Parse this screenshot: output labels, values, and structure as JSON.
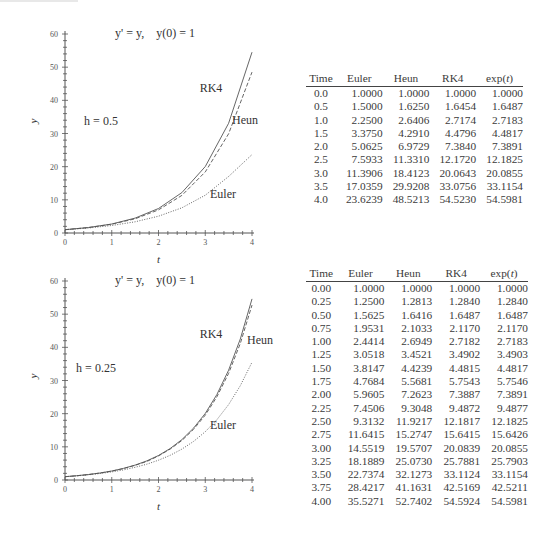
{
  "chart_data": [
    {
      "type": "line",
      "title": "y' = y,    y(0) = 1",
      "annotation": "h = 0.5",
      "xlabel": "t",
      "ylabel": "y",
      "xlim": [
        0,
        4
      ],
      "ylim": [
        0,
        60
      ],
      "xticks": [
        "0",
        "1",
        "2",
        "3",
        "4"
      ],
      "yticks": [
        "0",
        "10",
        "20",
        "30",
        "40",
        "50",
        "60"
      ],
      "grid": false,
      "x": [
        0.0,
        0.5,
        1.0,
        1.5,
        2.0,
        2.5,
        3.0,
        3.5,
        4.0
      ],
      "series": [
        {
          "name": "Euler",
          "style": "dotted",
          "values": [
            1.0,
            1.5,
            2.25,
            3.375,
            5.0625,
            7.5933,
            11.3906,
            17.0359,
            23.6239
          ]
        },
        {
          "name": "Heun",
          "style": "dashed",
          "values": [
            1.0,
            1.625,
            2.6406,
            4.291,
            6.9729,
            11.331,
            18.4123,
            29.9208,
            48.5213
          ]
        },
        {
          "name": "RK4",
          "style": "solid",
          "values": [
            1.0,
            1.6454,
            2.7174,
            4.4796,
            7.384,
            12.172,
            20.0643,
            33.0756,
            54.523
          ]
        }
      ]
    },
    {
      "type": "line",
      "title": "y' = y,    y(0) = 1",
      "annotation": "h = 0.25",
      "xlabel": "t",
      "ylabel": "y",
      "xlim": [
        0,
        4
      ],
      "ylim": [
        0,
        60
      ],
      "xticks": [
        "0",
        "1",
        "2",
        "3",
        "4"
      ],
      "yticks": [
        "0",
        "10",
        "20",
        "30",
        "40",
        "50",
        "60"
      ],
      "grid": false,
      "x": [
        0.0,
        0.25,
        0.5,
        0.75,
        1.0,
        1.25,
        1.5,
        1.75,
        2.0,
        2.25,
        2.5,
        2.75,
        3.0,
        3.25,
        3.5,
        3.75,
        4.0
      ],
      "series": [
        {
          "name": "Euler",
          "style": "dotted",
          "values": [
            1.0,
            1.25,
            1.5625,
            1.9531,
            2.4414,
            3.0518,
            3.8147,
            4.7684,
            5.9605,
            7.4506,
            9.3132,
            11.6415,
            14.5519,
            18.1889,
            22.7374,
            28.4217,
            35.5271
          ]
        },
        {
          "name": "Heun",
          "style": "dashed",
          "values": [
            1.0,
            1.2813,
            1.6416,
            2.1033,
            2.6949,
            3.4521,
            4.4239,
            5.5681,
            7.2623,
            9.3048,
            11.9217,
            15.2747,
            19.5707,
            25.073,
            32.1273,
            41.1631,
            52.7402
          ]
        },
        {
          "name": "RK4",
          "style": "solid",
          "values": [
            1.0,
            1.284,
            1.6487,
            2.117,
            2.7182,
            3.4902,
            4.4815,
            5.7543,
            7.3887,
            9.4872,
            12.1817,
            15.6415,
            20.0839,
            25.7881,
            33.1124,
            42.5169,
            54.5924
          ]
        }
      ]
    },
    {
      "type": "table",
      "columns": [
        "Time",
        "Euler",
        "Heun",
        "RK4",
        "exp(t)"
      ],
      "rows": [
        [
          "0.0",
          "1.0000",
          "1.0000",
          "1.0000",
          "1.0000"
        ],
        [
          "0.5",
          "1.5000",
          "1.6250",
          "1.6454",
          "1.6487"
        ],
        [
          "1.0",
          "2.2500",
          "2.6406",
          "2.7174",
          "2.7183"
        ],
        [
          "1.5",
          "3.3750",
          "4.2910",
          "4.4796",
          "4.4817"
        ],
        [
          "2.0",
          "5.0625",
          "6.9729",
          "7.3840",
          "7.3891"
        ],
        [
          "2.5",
          "7.5933",
          "11.3310",
          "12.1720",
          "12.1825"
        ],
        [
          "3.0",
          "11.3906",
          "18.4123",
          "20.0643",
          "20.0855"
        ],
        [
          "3.5",
          "17.0359",
          "29.9208",
          "33.0756",
          "33.1154"
        ],
        [
          "4.0",
          "23.6239",
          "48.5213",
          "54.5230",
          "54.5981"
        ]
      ]
    },
    {
      "type": "table",
      "columns": [
        "Time",
        "Euler",
        "Heun",
        "RK4",
        "exp(t)"
      ],
      "rows": [
        [
          "0.00",
          "1.0000",
          "1.0000",
          "1.0000",
          "1.0000"
        ],
        [
          "0.25",
          "1.2500",
          "1.2813",
          "1.2840",
          "1.2840"
        ],
        [
          "0.50",
          "1.5625",
          "1.6416",
          "1.6487",
          "1.6487"
        ],
        [
          "0.75",
          "1.9531",
          "2.1033",
          "2.1170",
          "2.1170"
        ],
        [
          "1.00",
          "2.4414",
          "2.6949",
          "2.7182",
          "2.7183"
        ],
        [
          "1.25",
          "3.0518",
          "3.4521",
          "3.4902",
          "3.4903"
        ],
        [
          "1.50",
          "3.8147",
          "4.4239",
          "4.4815",
          "4.4817"
        ],
        [
          "1.75",
          "4.7684",
          "5.5681",
          "5.7543",
          "5.7546"
        ],
        [
          "2.00",
          "5.9605",
          "7.2623",
          "7.3887",
          "7.3891"
        ],
        [
          "2.25",
          "7.4506",
          "9.3048",
          "9.4872",
          "9.4877"
        ],
        [
          "2.50",
          "9.3132",
          "11.9217",
          "12.1817",
          "12.1825"
        ],
        [
          "2.75",
          "11.6415",
          "15.2747",
          "15.6415",
          "15.6426"
        ],
        [
          "3.00",
          "14.5519",
          "19.5707",
          "20.0839",
          "20.0855"
        ],
        [
          "3.25",
          "18.1889",
          "25.0730",
          "25.7881",
          "25.7903"
        ],
        [
          "3.50",
          "22.7374",
          "32.1273",
          "33.1124",
          "33.1154"
        ],
        [
          "3.75",
          "28.4217",
          "41.1631",
          "42.5169",
          "42.5211"
        ],
        [
          "4.00",
          "35.5271",
          "52.7402",
          "54.5924",
          "54.5981"
        ]
      ]
    }
  ],
  "colors": {
    "axis": "#555555",
    "line": "#555555",
    "text": "#333333"
  }
}
